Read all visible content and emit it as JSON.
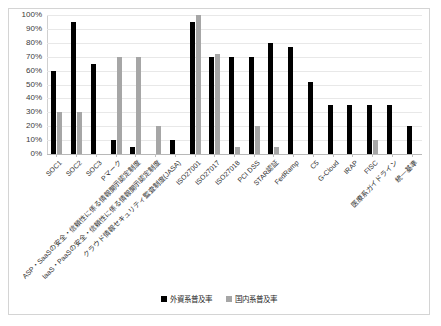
{
  "chart_data": {
    "type": "bar",
    "title": "",
    "subtitle": "",
    "xlabel": "",
    "ylabel": "",
    "ylim": [
      0,
      100
    ],
    "ytick_labels": [
      "100%",
      "90%",
      "80%",
      "70%",
      "60%",
      "50%",
      "40%",
      "30%",
      "20%",
      "10%",
      "0%"
    ],
    "ytick_values": [
      100,
      90,
      80,
      70,
      60,
      50,
      40,
      30,
      20,
      10,
      0
    ],
    "grid": true,
    "legend_position": "bottom-center",
    "categories": [
      "SOC1",
      "SOC2",
      "SOC3",
      "Pマーク",
      "ASP・SaaSの安全・信頼性に係る情報開示認定制度",
      "IaaS・PaaSの安全・信頼性に係る情報開示認定制度",
      "クラウド情報セキュリティ監査制度(JASA)",
      "ISO27001",
      "ISO27017",
      "ISO27018",
      "PCI DSS",
      "STAR認証",
      "FedRamp",
      "C5",
      "G-Cloud",
      "IRAP",
      "FISC",
      "医療系ガイドライン",
      "統一基準"
    ],
    "series": [
      {
        "name": "外資系普及率",
        "color": "#000000",
        "values": [
          60,
          95,
          65,
          10,
          5,
          0,
          10,
          95,
          70,
          70,
          70,
          80,
          77,
          52,
          35,
          35,
          35,
          35,
          20
        ]
      },
      {
        "name": "国内系普及率",
        "color": "#A6A6A6",
        "values": [
          30,
          30,
          0,
          70,
          70,
          20,
          0,
          100,
          72,
          5,
          20,
          5,
          0,
          0,
          0,
          0,
          10,
          0,
          0
        ]
      }
    ]
  },
  "legend": {
    "items": [
      {
        "label": "外資系普及率",
        "marker": "black-square-marker"
      },
      {
        "label": "国内系普及率",
        "marker": "gray-square-marker"
      }
    ]
  }
}
